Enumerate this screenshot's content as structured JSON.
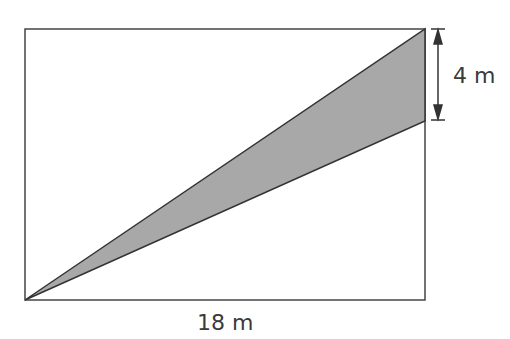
{
  "diagram": {
    "rectangle": {
      "x": 25,
      "y": 29,
      "width": 400,
      "height": 271
    },
    "shaded_triangle": {
      "points": [
        [
          25,
          300
        ],
        [
          425,
          29
        ],
        [
          425,
          121
        ]
      ],
      "fill": "#a8a8a8"
    },
    "labels": {
      "height": "4 m",
      "width": "18 m"
    }
  }
}
